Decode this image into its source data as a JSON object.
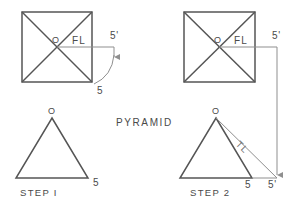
{
  "figure": {
    "title": "PYRAMID",
    "line_color": "#555555",
    "thin_line_color": "#8f8f8f",
    "text_color": "#4a4a4a",
    "background": "#ffffff"
  },
  "step1": {
    "caption": "STEP I",
    "plan": {
      "center_label": "O",
      "fold_line_label": "FL",
      "true_length_dim_label": "5'",
      "base_dim_label": "5"
    },
    "elevation": {
      "apex_label": "O",
      "base_dim_label": "5"
    }
  },
  "step2": {
    "caption": "STEP 2",
    "plan": {
      "center_label": "O",
      "fold_line_label": "FL",
      "true_length_dim_label": "5'"
    },
    "elevation": {
      "apex_label": "O",
      "slant_label": "TL",
      "base_dim_label": "5",
      "projected_dim_label": "5'"
    }
  }
}
